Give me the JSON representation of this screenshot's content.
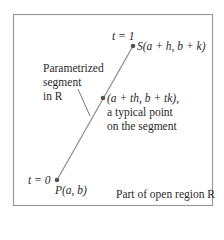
{
  "diagram": {
    "region_caption": "Part of open region R",
    "segment_label": [
      "Parametrized",
      "segment",
      "in R"
    ],
    "end_point": {
      "t_label": "t = 1",
      "label": "S(a + h, b + k)"
    },
    "start_point": {
      "t_label": "t = 0",
      "label": "P(a, b)"
    },
    "typical_point": {
      "label": "(a + th, b + tk),",
      "desc_line1": "a typical point",
      "desc_line2": "on the segment"
    },
    "colors": {
      "segment": "#8a8a8a",
      "point": "#555555",
      "border": "#9a9a9a",
      "text": "#2a2a2a"
    }
  }
}
